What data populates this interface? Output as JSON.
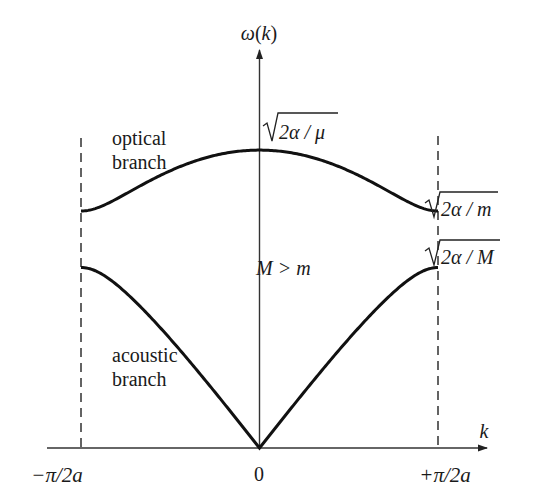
{
  "figure": {
    "y_axis_label": "ω(k)",
    "x_axis_label": "k",
    "x_ticks": [
      {
        "label": "−π/2a",
        "k": -1
      },
      {
        "label": "0",
        "k": 0
      },
      {
        "label": "+π/2a",
        "k": 1
      }
    ],
    "branch_labels": {
      "optical_line1": "optical",
      "optical_line2": "branch",
      "acoustic_line1": "acoustic",
      "acoustic_line2": "branch"
    },
    "annotations": {
      "optical_max": "2α / μ",
      "optical_edge": "2α / m",
      "acoustic_edge": "2α / M",
      "condition": "M > m"
    },
    "colors": {
      "curve": "#111111",
      "axis": "#333333",
      "text": "#1a1a1a",
      "background": "#ffffff"
    }
  },
  "chart_data": {
    "type": "line",
    "title": "",
    "xlabel": "k",
    "ylabel": "ω(k)",
    "x_range": [
      "−π/2a",
      "+π/2a"
    ],
    "mass_ratio_m_over_M": 0.58,
    "series": [
      {
        "name": "optical branch",
        "values_relative": {
          "k=0": "√(2α/μ)",
          "k=±π/2a": "√(2α/m)"
        },
        "shape": "maximum at k=0, decreasing to flat at zone boundary"
      },
      {
        "name": "acoustic branch",
        "values_relative": {
          "k=0": "0",
          "k=±π/2a": "√(2α/M)"
        },
        "shape": "linear near k=0, flattening at zone boundary"
      }
    ],
    "boundaries": [
      "k = −π/2a (dashed)",
      "k = +π/2a (dashed)"
    ],
    "grid": false,
    "legend": "none (branches labeled inline)"
  }
}
